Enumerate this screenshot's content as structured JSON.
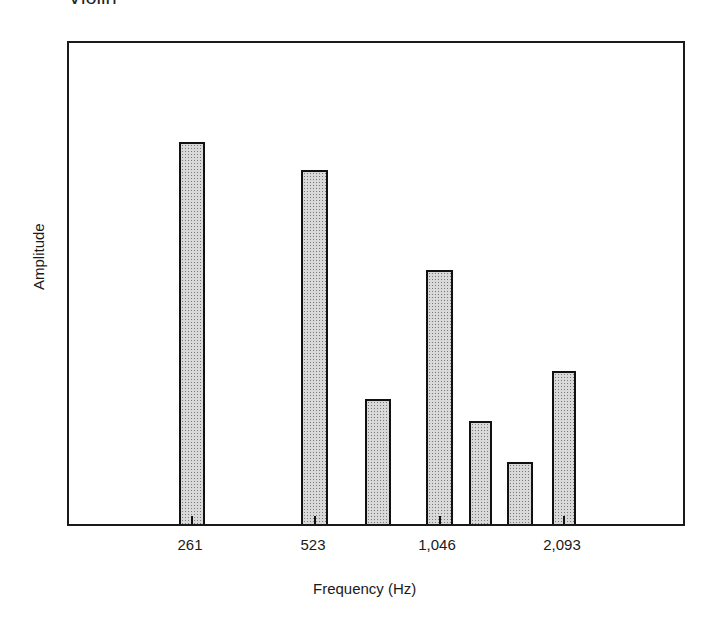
{
  "header": {
    "caption_partial": "Violin"
  },
  "chart_data": {
    "type": "bar",
    "title": "",
    "xlabel": "Frequency (Hz)",
    "ylabel": "Amplitude",
    "x_scale": "log2 (octaves)",
    "x": [
      261,
      523,
      784,
      1046,
      1307,
      1568,
      2093
    ],
    "values": [
      78.6,
      72.8,
      25.7,
      52.3,
      21.2,
      12.8,
      31.5
    ],
    "value_units": "relative amplitude (% of frame height, no axis ticks shown)",
    "tick_labels": [
      "261",
      "523",
      "1,046",
      "2,093"
    ],
    "tick_values": [
      261,
      523,
      1046,
      2093
    ],
    "ylim": [
      0,
      100
    ],
    "grid": false,
    "legend": null
  },
  "layout": {
    "bars": [
      {
        "left": 110,
        "width": 26,
        "height": 382,
        "tick": true
      },
      {
        "left": 232,
        "width": 27,
        "height": 354,
        "tick": true
      },
      {
        "left": 296,
        "width": 26,
        "height": 125,
        "tick": false
      },
      {
        "left": 357,
        "width": 27,
        "height": 254,
        "tick": true
      },
      {
        "left": 400,
        "width": 23,
        "height": 103,
        "tick": false
      },
      {
        "left": 438,
        "width": 26,
        "height": 62,
        "tick": false
      },
      {
        "left": 483,
        "width": 24,
        "height": 153,
        "tick": true
      }
    ],
    "label_positions": [
      190,
      313,
      437,
      562
    ]
  }
}
